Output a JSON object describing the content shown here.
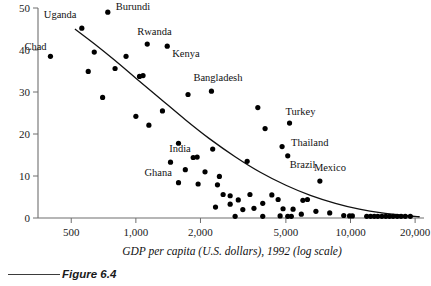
{
  "figure": {
    "caption": "Figure 6.4"
  },
  "chart_data": {
    "type": "scatter",
    "title": "",
    "xlabel": "GDP per capita (U.S. dollars), 1992 (log scale)",
    "ylabel": "",
    "xscale": "log",
    "xlim": [
      350,
      22000
    ],
    "ylim": [
      0,
      50
    ],
    "grid": false,
    "legend": null,
    "x_ticks": [
      {
        "value": 500,
        "label": "500"
      },
      {
        "value": 1000,
        "label": "1,000"
      },
      {
        "value": 2000,
        "label": "2,000"
      },
      {
        "value": 5000,
        "label": "5,000"
      },
      {
        "value": 10000,
        "label": "10,000"
      },
      {
        "value": 20000,
        "label": "20,000"
      }
    ],
    "y_ticks": [
      {
        "value": 0,
        "label": "0"
      },
      {
        "value": 10,
        "label": "10"
      },
      {
        "value": 20,
        "label": "20"
      },
      {
        "value": 30,
        "label": "30"
      },
      {
        "value": 40,
        "label": "40"
      },
      {
        "value": 50,
        "label": "50"
      }
    ],
    "points": [
      {
        "x": 400,
        "y": 38.5,
        "label": "Chad",
        "label_dx": -26,
        "label_dy": -6
      },
      {
        "x": 560,
        "y": 45.2,
        "label": "Uganda",
        "label_dx": -38,
        "label_dy": -10
      },
      {
        "x": 740,
        "y": 49.0,
        "label": "Burundi",
        "label_dx": 8,
        "label_dy": -2
      },
      {
        "x": 1130,
        "y": 41.4,
        "label": "Rwanda",
        "label_dx": -10,
        "label_dy": -9
      },
      {
        "x": 1400,
        "y": 40.9,
        "label": "Kenya",
        "label_dx": 5,
        "label_dy": 11
      },
      {
        "x": 2250,
        "y": 30.2,
        "label": "Bangladesh",
        "label_dx": -18,
        "label_dy": -10
      },
      {
        "x": 1450,
        "y": 13.3,
        "label": "Ghana",
        "label_dx": -26,
        "label_dy": 14
      },
      {
        "x": 1850,
        "y": 14.4,
        "label": "India",
        "label_dx": -24,
        "label_dy": -6
      },
      {
        "x": 5200,
        "y": 22.6,
        "label": "Turkey",
        "label_dx": -4,
        "label_dy": -8
      },
      {
        "x": 4800,
        "y": 17.0,
        "label": "Thailand",
        "label_dx": 9,
        "label_dy": -1
      },
      {
        "x": 5100,
        "y": 14.8,
        "label": "Brazil",
        "label_dx": 2,
        "label_dy": 12
      },
      {
        "x": 7200,
        "y": 8.8,
        "label": "Mexico",
        "label_dx": -6,
        "label_dy": -10
      },
      {
        "x": 640,
        "y": 39.5,
        "label": null
      },
      {
        "x": 900,
        "y": 38.5,
        "label": null
      },
      {
        "x": 600,
        "y": 34.9,
        "label": null
      },
      {
        "x": 800,
        "y": 35.6,
        "label": null
      },
      {
        "x": 1040,
        "y": 33.7,
        "label": null
      },
      {
        "x": 1080,
        "y": 33.9,
        "label": null
      },
      {
        "x": 700,
        "y": 28.7,
        "label": null
      },
      {
        "x": 1750,
        "y": 29.4,
        "label": null
      },
      {
        "x": 3700,
        "y": 26.3,
        "label": null
      },
      {
        "x": 1330,
        "y": 25.5,
        "label": null
      },
      {
        "x": 1000,
        "y": 24.2,
        "label": null
      },
      {
        "x": 1150,
        "y": 22.1,
        "label": null
      },
      {
        "x": 4000,
        "y": 21.3,
        "label": null
      },
      {
        "x": 1580,
        "y": 17.8,
        "label": null
      },
      {
        "x": 2280,
        "y": 16.4,
        "label": null
      },
      {
        "x": 1930,
        "y": 14.5,
        "label": null
      },
      {
        "x": 3300,
        "y": 13.5,
        "label": null
      },
      {
        "x": 1700,
        "y": 11.5,
        "label": null
      },
      {
        "x": 2100,
        "y": 11.0,
        "label": null
      },
      {
        "x": 2450,
        "y": 9.9,
        "label": null
      },
      {
        "x": 1580,
        "y": 8.4,
        "label": null
      },
      {
        "x": 1950,
        "y": 8.1,
        "label": null
      },
      {
        "x": 2400,
        "y": 7.9,
        "label": null
      },
      {
        "x": 2550,
        "y": 5.6,
        "label": null
      },
      {
        "x": 2350,
        "y": 2.6,
        "label": null
      },
      {
        "x": 2750,
        "y": 5.3,
        "label": null
      },
      {
        "x": 2750,
        "y": 3.3,
        "label": null
      },
      {
        "x": 3000,
        "y": 4.3,
        "label": null
      },
      {
        "x": 3150,
        "y": 2.0,
        "label": null
      },
      {
        "x": 3400,
        "y": 5.6,
        "label": null
      },
      {
        "x": 3550,
        "y": 2.3,
        "label": null
      },
      {
        "x": 3900,
        "y": 3.5,
        "label": null
      },
      {
        "x": 4300,
        "y": 5.5,
        "label": null
      },
      {
        "x": 4600,
        "y": 4.4,
        "label": null
      },
      {
        "x": 4850,
        "y": 2.2,
        "label": null
      },
      {
        "x": 5400,
        "y": 2.1,
        "label": null
      },
      {
        "x": 6000,
        "y": 4.2,
        "label": null
      },
      {
        "x": 6300,
        "y": 4.4,
        "label": null
      },
      {
        "x": 6900,
        "y": 1.6,
        "label": null
      },
      {
        "x": 2900,
        "y": 0.4,
        "label": null
      },
      {
        "x": 3900,
        "y": 0.4,
        "label": null
      },
      {
        "x": 4700,
        "y": 0.5,
        "label": null
      },
      {
        "x": 5100,
        "y": 0.4,
        "label": null
      },
      {
        "x": 5300,
        "y": 0.4,
        "label": null
      },
      {
        "x": 5900,
        "y": 0.9,
        "label": null
      },
      {
        "x": 8000,
        "y": 1.2,
        "label": null
      },
      {
        "x": 9300,
        "y": 0.6,
        "label": null
      },
      {
        "x": 9900,
        "y": 0.5,
        "label": null
      },
      {
        "x": 10200,
        "y": 0.5,
        "label": null
      },
      {
        "x": 11900,
        "y": 0.4,
        "label": null
      },
      {
        "x": 12400,
        "y": 0.4,
        "label": null
      },
      {
        "x": 12900,
        "y": 0.4,
        "label": null
      },
      {
        "x": 13400,
        "y": 0.4,
        "label": null
      },
      {
        "x": 14000,
        "y": 0.4,
        "label": null
      },
      {
        "x": 14600,
        "y": 0.4,
        "label": null
      },
      {
        "x": 15200,
        "y": 0.4,
        "label": null
      },
      {
        "x": 15800,
        "y": 0.4,
        "label": null
      },
      {
        "x": 16500,
        "y": 0.4,
        "label": null
      },
      {
        "x": 17200,
        "y": 0.4,
        "label": null
      },
      {
        "x": 18000,
        "y": 0.4,
        "label": null
      },
      {
        "x": 19000,
        "y": 0.4,
        "label": null
      }
    ],
    "trend_curve": {
      "description": "fitted downward-sloping curve",
      "points": [
        {
          "x": 520,
          "y": 45.0
        },
        {
          "x": 640,
          "y": 41.5
        },
        {
          "x": 800,
          "y": 37.5
        },
        {
          "x": 1000,
          "y": 33.3
        },
        {
          "x": 1300,
          "y": 28.4
        },
        {
          "x": 1700,
          "y": 23.4
        },
        {
          "x": 2200,
          "y": 18.9
        },
        {
          "x": 2900,
          "y": 14.6
        },
        {
          "x": 3800,
          "y": 10.9
        },
        {
          "x": 5000,
          "y": 7.8
        },
        {
          "x": 6500,
          "y": 5.4
        },
        {
          "x": 8500,
          "y": 3.5
        },
        {
          "x": 11000,
          "y": 2.1
        },
        {
          "x": 14000,
          "y": 1.2
        },
        {
          "x": 18000,
          "y": 0.6
        },
        {
          "x": 21000,
          "y": 0.3
        }
      ]
    }
  }
}
